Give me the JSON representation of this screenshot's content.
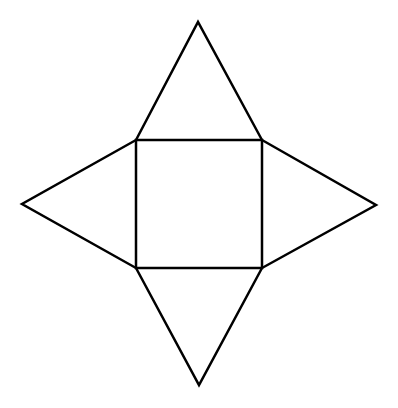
{
  "diagram": {
    "stroke_color": "#000000",
    "background_color": "#ffffff",
    "stroke_width": 2.5,
    "square": {
      "top_left": [
        136,
        140
      ],
      "top_right": [
        262,
        140
      ],
      "bottom_right": [
        262,
        268
      ],
      "bottom_left": [
        136,
        268
      ]
    },
    "triangles": [
      {
        "name": "top",
        "apex": [
          198,
          22
        ]
      },
      {
        "name": "right",
        "apex": [
          376,
          205
        ]
      },
      {
        "name": "bottom",
        "apex": [
          199,
          385
        ]
      },
      {
        "name": "left",
        "apex": [
          22,
          204
        ]
      }
    ]
  }
}
